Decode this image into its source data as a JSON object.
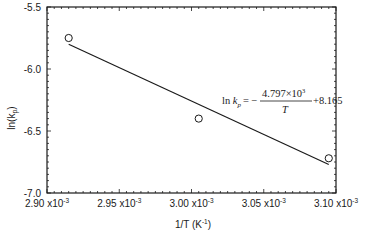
{
  "chart_data": {
    "type": "scatter",
    "title": "",
    "xlabel": "1/T (K⁻¹)",
    "ylabel": "ln(k_p)",
    "xlim": [
      0.0029,
      0.0031
    ],
    "ylim": [
      -7.0,
      -5.5
    ],
    "grid": false,
    "legend": null,
    "x_ticks": [
      0.0029,
      0.00295,
      0.003,
      0.00305,
      0.0031
    ],
    "x_tick_labels": [
      {
        "mant": "2.90",
        "exp": "-3"
      },
      {
        "mant": "2.95",
        "exp": "-3"
      },
      {
        "mant": "3.00",
        "exp": "-3"
      },
      {
        "mant": "3.05",
        "exp": "-3"
      },
      {
        "mant": "3.10",
        "exp": "-3"
      }
    ],
    "y_ticks": [
      -5.5,
      -6.0,
      -6.5,
      -7.0
    ],
    "y_tick_labels": [
      "-5.5",
      "-6.0",
      "-6.5",
      "-7.0"
    ],
    "series": [
      {
        "name": "experimental",
        "marker": "open-circle",
        "points_note": "Values estimated from marker pixel positions; not read from a source table.",
        "points": [
          {
            "x": 0.002915,
            "y": -5.75
          },
          {
            "x": 0.003005,
            "y": -6.4
          },
          {
            "x": 0.003095,
            "y": -6.72
          }
        ]
      },
      {
        "name": "fit",
        "type": "line",
        "line_note": "Endpoints estimated from the drawn line's pixel position, not computed from the printed equation.",
        "from": {
          "x": 0.002915,
          "y": -5.8
        },
        "to": {
          "x": 0.003095,
          "y": -6.77
        },
        "slope_implied_by_drawn_line": -5400,
        "slope_printed_in_equation": -4797,
        "consistency_note": "The printed equation does not match the drawn line: at x=0.003095 it gives -6.68 vs. about -6.77 drawn (~0.09 off), and the drawn line implies slope near -5400, not -4797. Possible causes: misreading the pixels, an equation that does not correspond to this line, or a separate fit. Not verified."
      }
    ],
    "annotations": [
      {
        "text": "ln k_p = − 4.797×10³ / T + 8.165",
        "position": {
          "x": 0.003012,
          "y": -6.17
        },
        "verified_against_plot": false
      }
    ]
  },
  "labels": {
    "ylabel_main": "ln(k",
    "ylabel_sub": "p",
    "ylabel_close": ")",
    "xlabel_main": "1/T (K",
    "xlabel_sup": "-1",
    "xlabel_close": ")",
    "times": "x10",
    "eq_ln": "ln",
    "eq_k": "k",
    "eq_sub": "p",
    "eq_equals": "= −",
    "eq_num": "4.797×10",
    "eq_num_exp": "3",
    "eq_den": "T",
    "eq_tail": "+8.165"
  }
}
